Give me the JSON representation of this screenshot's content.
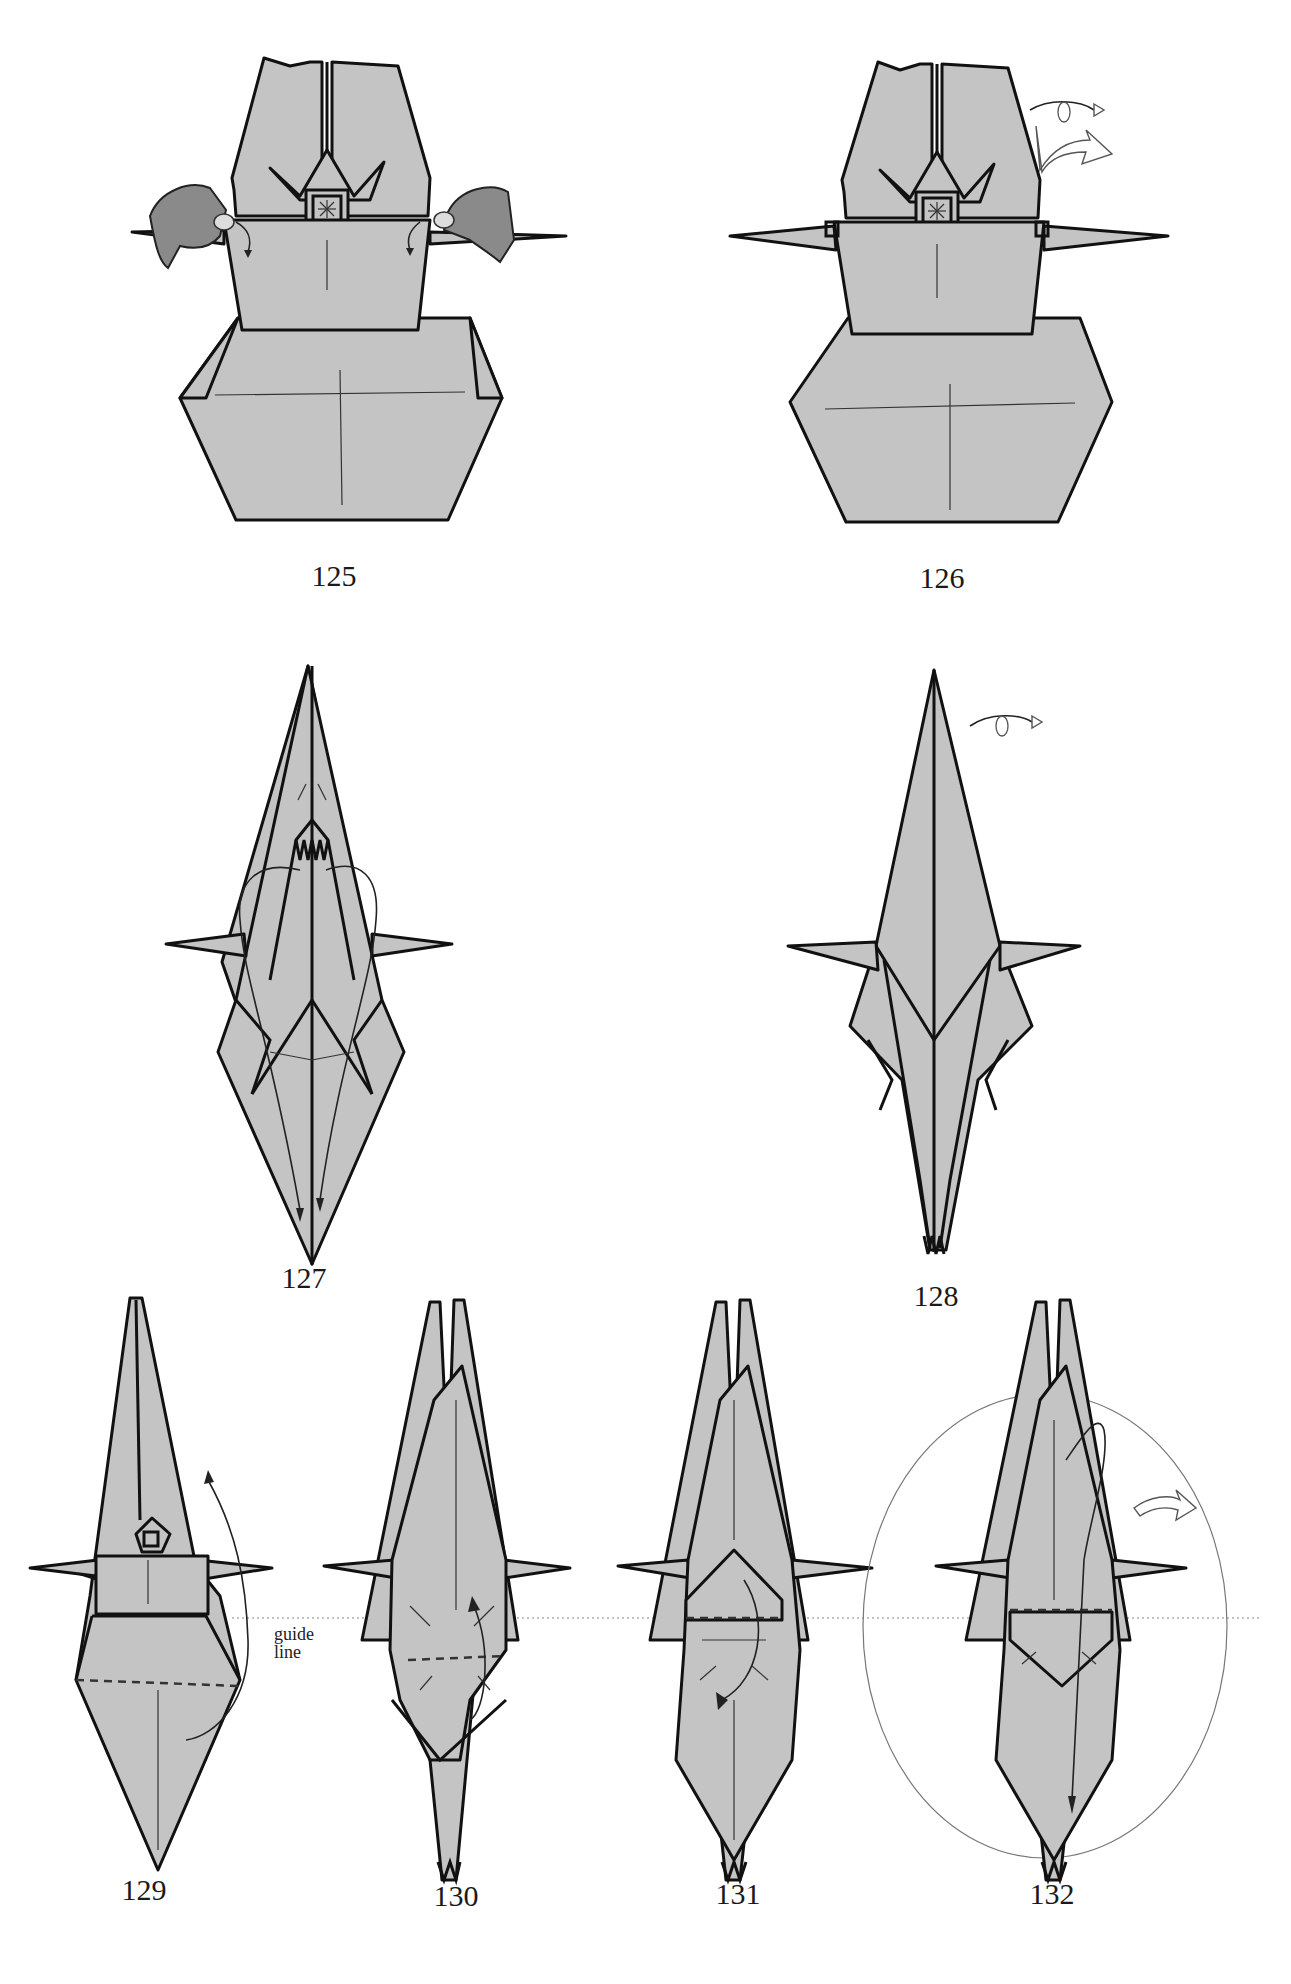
{
  "page": {
    "type": "origami-instructions",
    "background": "#ffffff",
    "paper_color": "#c4c4c4",
    "line_color": "#111111"
  },
  "steps": [
    {
      "number": "125",
      "description": "hands pulling side points out"
    },
    {
      "number": "126",
      "description": "turn over, rotate symbols"
    },
    {
      "number": "127",
      "description": "inside-reverse folds with arrows"
    },
    {
      "number": "128",
      "description": "turn over symbol"
    },
    {
      "number": "129",
      "description": "fold up along dashed line",
      "annotation": "guide\nline"
    },
    {
      "number": "130",
      "description": "fold down"
    },
    {
      "number": "131",
      "description": "fold down"
    },
    {
      "number": "132",
      "description": "fold down, circled area, flip arrow"
    }
  ],
  "annotations": {
    "guide_line_word1": "guide",
    "guide_line_word2": "line"
  }
}
